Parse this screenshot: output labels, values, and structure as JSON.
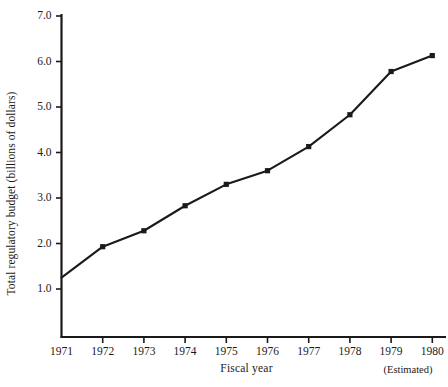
{
  "chart_data": {
    "type": "line",
    "title": "",
    "subtitle": "",
    "xlabel": "Fiscal year",
    "ylabel": "Total regulatory budget (billions of dollars)",
    "annotations": [
      "(Estimated)"
    ],
    "categories": [
      "1971",
      "1972",
      "1973",
      "1974",
      "1975",
      "1976",
      "1977",
      "1978",
      "1979",
      "1980"
    ],
    "x": [
      1971,
      1972,
      1973,
      1974,
      1975,
      1976,
      1977,
      1978,
      1979,
      1980
    ],
    "values": [
      1.25,
      1.93,
      2.28,
      2.83,
      3.3,
      3.6,
      4.13,
      4.83,
      5.78,
      6.13
    ],
    "series": [
      {
        "name": "Total regulatory budget",
        "values": [
          1.25,
          1.93,
          2.28,
          2.83,
          3.3,
          3.6,
          4.13,
          4.83,
          5.78,
          6.13
        ]
      }
    ],
    "xlim": [
      1971,
      1980
    ],
    "ylim": [
      0.4,
      7.0
    ],
    "ytick_labels": [
      "7.0",
      "6.0",
      "5.0",
      "4.0",
      "3.0",
      "2.0",
      "1.0"
    ],
    "ytick_values": [
      7.0,
      6.0,
      5.0,
      4.0,
      3.0,
      2.0,
      1.0
    ],
    "xtick_labels": [
      "1971",
      "1972",
      "1973",
      "1974",
      "1975",
      "1976",
      "1977",
      "1978",
      "1979",
      "1980"
    ],
    "grid": false,
    "legend": false,
    "legend_position": "none",
    "marker": "square",
    "line_color": "#1a1a1a",
    "marker_color": "#1a1a1a",
    "background_color": "#ffffff"
  },
  "axes": {
    "y_title": "Total regulatory budget (billions of dollars)",
    "x_title": "Fiscal year",
    "estimated_note": "(Estimated)",
    "y_ticks": [
      {
        "label": "7.0",
        "value": 7.0
      },
      {
        "label": "6.0",
        "value": 6.0
      },
      {
        "label": "5.0",
        "value": 5.0
      },
      {
        "label": "4.0",
        "value": 4.0
      },
      {
        "label": "3.0",
        "value": 3.0
      },
      {
        "label": "2.0",
        "value": 2.0
      },
      {
        "label": "1.0",
        "value": 1.0
      }
    ],
    "x_ticks": [
      {
        "label": "1971",
        "value": 1971
      },
      {
        "label": "1972",
        "value": 1972
      },
      {
        "label": "1973",
        "value": 1973
      },
      {
        "label": "1974",
        "value": 1974
      },
      {
        "label": "1975",
        "value": 1975
      },
      {
        "label": "1976",
        "value": 1976
      },
      {
        "label": "1977",
        "value": 1977
      },
      {
        "label": "1978",
        "value": 1978
      },
      {
        "label": "1979",
        "value": 1979
      },
      {
        "label": "1980",
        "value": 1980
      }
    ]
  }
}
